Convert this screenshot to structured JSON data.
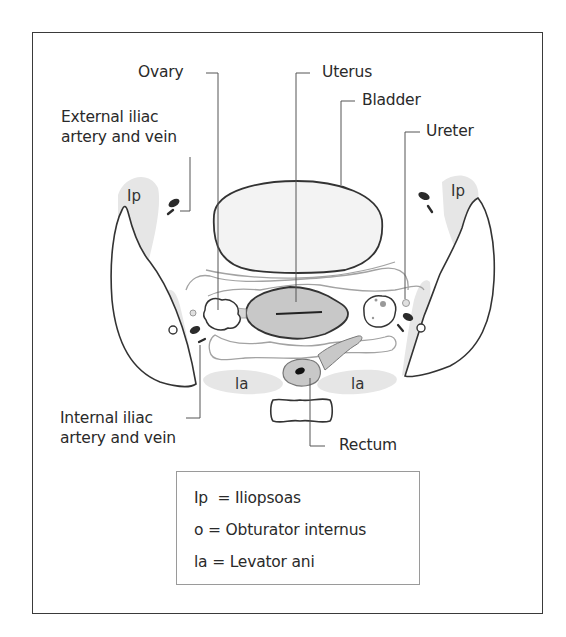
{
  "figure": {
    "labels": {
      "ovary": "Ovary",
      "uterus": "Uterus",
      "bladder": "Bladder",
      "ureter": "Ureter",
      "external_iliac_line1": "External iliac",
      "external_iliac_line2": "artery and vein",
      "internal_iliac_line1": "Internal iliac",
      "internal_iliac_line2": "artery and vein",
      "rectum": "Rectum"
    },
    "muscle_markers": {
      "iliopsoas": "Ip",
      "levator_ani": "la"
    },
    "legend": [
      {
        "abbr": "Ip",
        "sep": " = ",
        "term": "Iliopsoas"
      },
      {
        "abbr": "o",
        "sep": " = ",
        "term": "Obturator internus"
      },
      {
        "abbr": "la",
        "sep": " = ",
        "term": "Levator ani"
      }
    ],
    "colors": {
      "outline": "#333333",
      "muscle_fill": "#e6e6e6",
      "organ_fill": "#c9c9c9",
      "bladder_fill": "#f2f2f2",
      "vessel_fill": "#2b2b2b",
      "fascia": "#9a9a9a"
    }
  }
}
